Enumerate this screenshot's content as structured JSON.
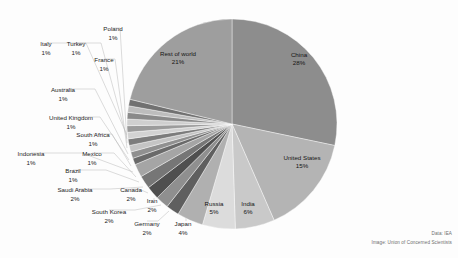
{
  "credits": {
    "data_line": "Data: IEA",
    "image_line": "Image: Union of Concerned Scientists"
  },
  "chart_data": {
    "type": "pie",
    "title": "",
    "subtitle": "",
    "xlabel": "",
    "ylabel": "",
    "grid": false,
    "legend_position": "none",
    "label_format": "{name}\n{value}%",
    "start_angle_deg": 0,
    "direction": "clockwise",
    "units": "percent",
    "center": {
      "x": 232,
      "y": 124,
      "radius": 105
    },
    "categories": [
      "China",
      "United States",
      "India",
      "Russia",
      "Japan",
      "Germany",
      "South Korea",
      "Iran",
      "Canada",
      "Saudi Arabia",
      "Brazil",
      "Mexico",
      "Indonesia",
      "South Africa",
      "United Kingdom",
      "Australia",
      "France",
      "Poland",
      "Turkey",
      "Italy",
      "Rest of world"
    ],
    "values": [
      28,
      15,
      6,
      5,
      4,
      2,
      2,
      2,
      2,
      2,
      1,
      1,
      1,
      1,
      1,
      1,
      1,
      1,
      1,
      1,
      21
    ],
    "slices": [
      {
        "name": "China",
        "value": 28,
        "label": "China",
        "percent_text": "28%",
        "color": "#8d8d8d",
        "label_placement": "inside",
        "label_x": 299,
        "label_y": 57,
        "pct_x": 299,
        "pct_y": 65
      },
      {
        "name": "United States",
        "value": 15,
        "label": "United States",
        "percent_text": "15%",
        "color": "#b4b4b4",
        "label_placement": "inside",
        "label_x": 302,
        "label_y": 160,
        "pct_x": 302,
        "pct_y": 168
      },
      {
        "name": "India",
        "value": 6,
        "label": "India",
        "percent_text": "6%",
        "color": "#c9c9c9",
        "label_placement": "inside",
        "label_x": 248,
        "label_y": 206,
        "pct_x": 248,
        "pct_y": 214
      },
      {
        "name": "Russia",
        "value": 5,
        "label": "Russia",
        "percent_text": "5%",
        "color": "#dcdcdc",
        "label_placement": "inside",
        "label_x": 214,
        "label_y": 206,
        "pct_x": 214,
        "pct_y": 214
      },
      {
        "name": "Japan",
        "value": 4,
        "label": "Japan",
        "percent_text": "4%",
        "color": "#b0b0b0",
        "label_placement": "outside",
        "label_x": 183,
        "label_y": 226,
        "pct_x": 183,
        "pct_y": 235,
        "leader": [
          [
            186,
            216
          ],
          [
            186,
            221
          ]
        ]
      },
      {
        "name": "Germany",
        "value": 2,
        "label": "Germany",
        "percent_text": "2%",
        "color": "#5f5f5f",
        "label_placement": "outside",
        "label_x": 147,
        "label_y": 226,
        "pct_x": 147,
        "pct_y": 235,
        "leader": [
          [
            169,
            211
          ],
          [
            158,
            221
          ],
          [
            147,
            221
          ]
        ]
      },
      {
        "name": "South Korea",
        "value": 2,
        "label": "South Korea",
        "percent_text": "2%",
        "color": "#8f8f8f",
        "label_placement": "outside",
        "label_x": 109,
        "label_y": 214,
        "pct_x": 109,
        "pct_y": 223,
        "leader": [
          [
            161,
            205
          ],
          [
            135,
            210
          ],
          [
            109,
            210
          ]
        ]
      },
      {
        "name": "Iran",
        "value": 2,
        "label": "Iran",
        "percent_text": "2%",
        "color": "#4f4f4f",
        "label_placement": "outside",
        "label_x": 152,
        "label_y": 203,
        "pct_x": 152,
        "pct_y": 212,
        "leader": [
          [
            155,
            199
          ],
          [
            153,
            199
          ]
        ]
      },
      {
        "name": "Canada",
        "value": 2,
        "label": "Canada",
        "percent_text": "2%",
        "color": "#767676",
        "label_placement": "outside",
        "label_x": 131,
        "label_y": 192,
        "pct_x": 131,
        "pct_y": 201,
        "leader": [
          [
            148,
            193
          ],
          [
            139,
            189
          ],
          [
            131,
            189
          ]
        ]
      },
      {
        "name": "Saudi Arabia",
        "value": 2,
        "label": "Saudi Arabia",
        "percent_text": "2%",
        "color": "#a5a5a5",
        "label_placement": "outside",
        "label_x": 75,
        "label_y": 192,
        "pct_x": 75,
        "pct_y": 201,
        "leader": [
          [
            143,
            187
          ],
          [
            110,
            189
          ],
          [
            75,
            189
          ]
        ]
      },
      {
        "name": "Brazil",
        "value": 1,
        "label": "Brazil",
        "percent_text": "1%",
        "color": "#6a6a6a",
        "label_placement": "outside",
        "label_x": 73,
        "label_y": 173,
        "pct_x": 73,
        "pct_y": 182,
        "leader": [
          [
            139,
            182
          ],
          [
            106,
            170
          ],
          [
            73,
            170
          ]
        ]
      },
      {
        "name": "Mexico",
        "value": 1,
        "label": "Mexico",
        "percent_text": "1%",
        "color": "#909090",
        "label_placement": "outside",
        "label_x": 92,
        "label_y": 156,
        "pct_x": 92,
        "pct_y": 165,
        "leader": [
          [
            136,
            177
          ],
          [
            114,
            153
          ],
          [
            92,
            153
          ]
        ]
      },
      {
        "name": "Indonesia",
        "value": 1,
        "label": "Indonesia",
        "percent_text": "1%",
        "color": "#c4c4c4",
        "label_placement": "outside",
        "label_x": 31,
        "label_y": 156,
        "pct_x": 31,
        "pct_y": 165,
        "leader": [
          [
            133,
            172
          ],
          [
            82,
            153
          ],
          [
            31,
            153
          ]
        ]
      },
      {
        "name": "South Africa",
        "value": 1,
        "label": "South Africa",
        "percent_text": "1%",
        "color": "#7c7c7c",
        "label_placement": "outside",
        "label_x": 93,
        "label_y": 137,
        "pct_x": 93,
        "pct_y": 146,
        "leader": [
          [
            131,
            166
          ],
          [
            112,
            134
          ],
          [
            93,
            134
          ]
        ]
      },
      {
        "name": "United Kingdom",
        "value": 1,
        "label": "United Kingdom",
        "percent_text": "1%",
        "color": "#d2d2d2",
        "label_placement": "outside",
        "label_x": 71,
        "label_y": 120,
        "pct_x": 71,
        "pct_y": 129,
        "leader": [
          [
            129,
            160
          ],
          [
            100,
            117
          ],
          [
            71,
            117
          ]
        ]
      },
      {
        "name": "Australia",
        "value": 1,
        "label": "Australia",
        "percent_text": "1%",
        "color": "#9b9b9b",
        "label_placement": "outside",
        "label_x": 63,
        "label_y": 92,
        "pct_x": 63,
        "pct_y": 101,
        "leader": [
          [
            128,
            154
          ],
          [
            95,
            89
          ],
          [
            63,
            89
          ]
        ]
      },
      {
        "name": "France",
        "value": 1,
        "label": "France",
        "percent_text": "1%",
        "color": "#cfcfcf",
        "label_placement": "outside",
        "label_x": 104,
        "label_y": 62,
        "pct_x": 104,
        "pct_y": 71,
        "leader": [
          [
            127,
            148
          ],
          [
            115,
            59
          ],
          [
            104,
            59
          ]
        ]
      },
      {
        "name": "Poland",
        "value": 1,
        "label": "Poland",
        "percent_text": "1%",
        "color": "#8a8a8a",
        "label_placement": "outside",
        "label_x": 113,
        "label_y": 31,
        "pct_x": 113,
        "pct_y": 40,
        "leader": [
          [
            127,
            143
          ],
          [
            120,
            28
          ],
          [
            113,
            28
          ]
        ]
      },
      {
        "name": "Turkey",
        "value": 1,
        "label": "Turkey",
        "percent_text": "1%",
        "color": "#bdbdbd",
        "label_placement": "outside",
        "label_x": 76,
        "label_y": 46,
        "pct_x": 76,
        "pct_y": 55,
        "leader": [
          [
            127,
            139
          ],
          [
            101,
            43
          ],
          [
            76,
            43
          ]
        ]
      },
      {
        "name": "Italy",
        "value": 1,
        "label": "Italy",
        "percent_text": "1%",
        "color": "#717171",
        "label_placement": "outside",
        "label_x": 46,
        "label_y": 46,
        "pct_x": 46,
        "pct_y": 55,
        "leader": [
          [
            127,
            135
          ],
          [
            86,
            43
          ],
          [
            46,
            43
          ]
        ]
      },
      {
        "name": "Rest of world",
        "value": 21,
        "label": "Rest of world",
        "percent_text": "21%",
        "color": "#9e9e9e",
        "label_placement": "inside",
        "label_x": 178,
        "label_y": 56,
        "pct_x": 178,
        "pct_y": 64
      }
    ]
  }
}
